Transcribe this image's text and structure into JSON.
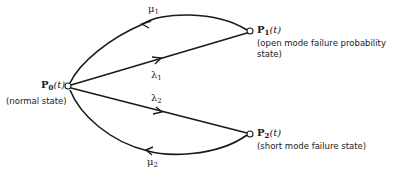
{
  "diagram": {
    "nodes": [
      {
        "id": "P0",
        "symbol": "P",
        "subscript": "0",
        "argument": "(t)",
        "description": "(normal state)"
      },
      {
        "id": "P1",
        "symbol": "P",
        "subscript": "1",
        "argument": "(t)",
        "description_line1": "(open mode failure  probability",
        "description_line2": "state)"
      },
      {
        "id": "P2",
        "symbol": "P",
        "subscript": "2",
        "argument": "(t)",
        "description": "(short mode failure state)"
      }
    ],
    "transitions": [
      {
        "from": "P0",
        "to": "P1",
        "symbol": "λ",
        "subscript": "1"
      },
      {
        "from": "P0",
        "to": "P2",
        "symbol": "λ",
        "subscript": "2"
      },
      {
        "from": "P1",
        "to": "P0",
        "symbol": "μ",
        "subscript": "1"
      },
      {
        "from": "P2",
        "to": "P0",
        "symbol": "μ",
        "subscript": "2"
      }
    ],
    "colors": {
      "line": "#1a1a1a",
      "background": "#ffffff"
    }
  }
}
